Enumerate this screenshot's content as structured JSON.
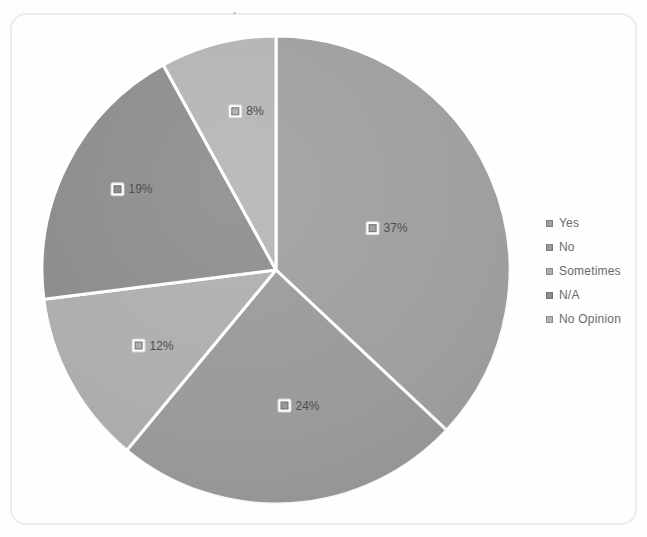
{
  "page": {
    "background_color": "#fdfdfd",
    "frame_border_color": "#ececec"
  },
  "chart_data": {
    "type": "pie",
    "title": "",
    "start_angle_deg": 0,
    "direction": "clockwise",
    "data_labels": "percent with legend key",
    "legend_position": "right",
    "separator_color": "#ffffff",
    "label_text_color": "#4f4f4f",
    "legend_text_color": "#6b6b6b",
    "slices": [
      {
        "label": "Yes",
        "value": 37,
        "display": "37%",
        "color": "#9f9f9f"
      },
      {
        "label": "No",
        "value": 24,
        "display": "24%",
        "color": "#9a9a9a"
      },
      {
        "label": "Sometimes",
        "value": 12,
        "display": "12%",
        "color": "#aeaeae"
      },
      {
        "label": "N/A",
        "value": 19,
        "display": "19%",
        "color": "#8c8c8c"
      },
      {
        "label": "No Opinion",
        "value": 8,
        "display": "8%",
        "color": "#b4b4b4"
      }
    ]
  },
  "legend": {
    "items": [
      "Yes",
      "No",
      "Sometimes",
      "N/A",
      "No Opinion"
    ]
  }
}
